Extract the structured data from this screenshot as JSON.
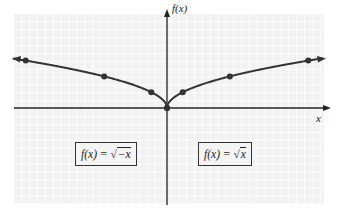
{
  "chart_data": {
    "type": "line",
    "title": "",
    "xlabel": "x",
    "ylabel": "f(x)",
    "grid": true,
    "series": [
      {
        "name": "f(x) = √x",
        "x": [
          0,
          1,
          4,
          9
        ],
        "y": [
          0,
          1,
          2,
          3
        ],
        "domain": "x ≥ 0",
        "arrow_end": "right"
      },
      {
        "name": "f(x) = √(−x)",
        "x": [
          0,
          -1,
          -4,
          -9
        ],
        "y": [
          0,
          1,
          2,
          3
        ],
        "domain": "x ≤ 0",
        "arrow_end": "left"
      }
    ],
    "annotations": [
      {
        "text": "f(x) = √−x",
        "position": "lower-left quadrant"
      },
      {
        "text": "f(x) = √x",
        "position": "lower-right quadrant"
      }
    ]
  },
  "labels": {
    "y_axis": "f(x)",
    "x_axis": "x",
    "left_eq_lhs": "f(x) = ",
    "left_eq_rad": "√",
    "left_eq_arg": "−x",
    "right_eq_lhs": "f(x) = ",
    "right_eq_rad": "√",
    "right_eq_arg": "x"
  },
  "colors": {
    "grid_bg": "#f2f2f2",
    "grid_line": "#ffffff",
    "curve": "#333333",
    "axis": "#222222"
  }
}
